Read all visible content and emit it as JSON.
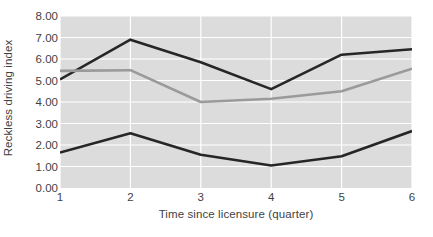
{
  "chart_data": {
    "type": "line",
    "title": "",
    "subtitle": "",
    "xlabel": "Time since licensure (quarter)",
    "ylabel": "Reckless driving index",
    "categories": [
      "1",
      "2",
      "3",
      "4",
      "5",
      "6"
    ],
    "x": [
      1,
      2,
      3,
      4,
      5,
      6
    ],
    "xlim": [
      1,
      6
    ],
    "ylim": [
      0.0,
      8.0
    ],
    "y_ticks": [
      "0.00",
      "1.00",
      "2.00",
      "3.00",
      "4.00",
      "5.00",
      "6.00",
      "7.00",
      "8.00"
    ],
    "y_tick_values": [
      0,
      1,
      2,
      3,
      4,
      5,
      6,
      7,
      8
    ],
    "y_tick_step": 1.0,
    "grid": true,
    "grid_color": "#ffffff",
    "plot_background": "#dcdcdc",
    "figure_background": "#ffffff",
    "legend": "none",
    "legend_position": "none",
    "annotations": [],
    "series": [
      {
        "name": "upper-dark-line",
        "color": "#262626",
        "line_width": 2.6,
        "values": [
          5.05,
          6.9,
          5.85,
          4.6,
          6.2,
          6.45
        ]
      },
      {
        "name": "middle-gray-line",
        "color": "#9a9a9a",
        "line_width": 2.6,
        "values": [
          5.45,
          5.48,
          4.0,
          4.15,
          4.5,
          5.55
        ]
      },
      {
        "name": "lower-dark-line",
        "color": "#262626",
        "line_width": 2.6,
        "values": [
          1.65,
          2.55,
          1.55,
          1.05,
          1.48,
          2.65
        ]
      }
    ]
  }
}
